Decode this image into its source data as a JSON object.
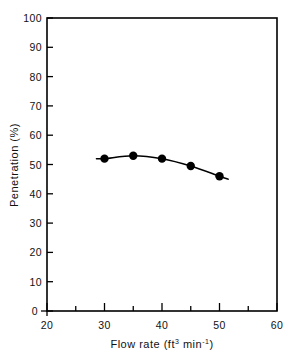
{
  "chart_data": {
    "type": "line",
    "title": "",
    "subtitle": "",
    "xlabel_parts": {
      "base": "Flow rate (ft",
      "sup1": "3",
      "mid": " min",
      "sup2": "-1",
      "tail": ")"
    },
    "xlabel": "Flow rate (ft3 min-1)",
    "ylabel": "Penetration (%)",
    "xlim": [
      20,
      60
    ],
    "ylim": [
      0,
      100
    ],
    "xticks": [
      20,
      30,
      40,
      50,
      60
    ],
    "xtick_labels": [
      "20",
      "30",
      "40",
      "50",
      "60"
    ],
    "xminor_ticks": [
      25,
      35,
      45,
      55
    ],
    "yticks": [
      0,
      10,
      20,
      30,
      40,
      50,
      60,
      70,
      80,
      90,
      100
    ],
    "ytick_labels": [
      "0",
      "10",
      "20",
      "30",
      "40",
      "50",
      "60",
      "70",
      "80",
      "90",
      "100"
    ],
    "grid": false,
    "legend": "none",
    "marker": "filled-circle",
    "marker_color": "#000000",
    "line_color": "#000000",
    "axis_color": "#000000",
    "background": "#ffffff",
    "series": [
      {
        "name": "penetration",
        "x": [
          30,
          35,
          40,
          45,
          50
        ],
        "values": [
          52.0,
          53.0,
          52.0,
          49.5,
          46.0
        ]
      }
    ],
    "line_extension": {
      "left_x": 28.6,
      "left_y": 52.0,
      "right_x": 51.5,
      "right_y": 45.0
    }
  },
  "axes": {
    "y_axis_name": "penetration-axis",
    "x_axis_name": "flow-rate-axis"
  }
}
